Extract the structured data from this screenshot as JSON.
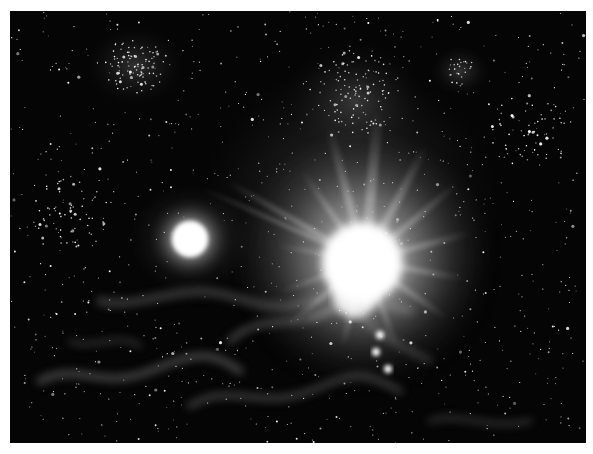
{
  "image": {
    "subject": "Grayscale starfield with a bright flaring star and a smaller glowing star amid nebula clouds",
    "colors": {
      "page_background": "#ffffff",
      "sky": "#050505",
      "nebula": "#8a8a8a",
      "star": "#ffffff"
    },
    "features": [
      {
        "name": "bright-flare-star",
        "x": 355,
        "y": 250,
        "radius": 48
      },
      {
        "name": "small-glowing-star",
        "x": 180,
        "y": 228,
        "radius": 20
      },
      {
        "name": "star-cluster-upper-left",
        "x": 125,
        "y": 55
      },
      {
        "name": "star-cluster-upper-center",
        "x": 345,
        "y": 75
      },
      {
        "name": "star-pair-upper-right",
        "x": 450,
        "y": 60
      },
      {
        "name": "bright-star-trio-below-flare",
        "x": 380,
        "y": 340
      }
    ]
  }
}
